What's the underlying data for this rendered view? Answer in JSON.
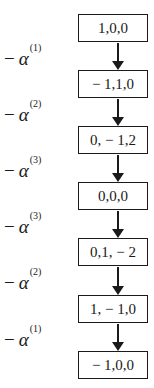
{
  "diagram": {
    "type": "vertical-flow",
    "nodes": [
      {
        "label": "1,0,0"
      },
      {
        "label": "− 1,1,0"
      },
      {
        "label": "0, − 1,2"
      },
      {
        "label": "0,0,0"
      },
      {
        "label": "0,1, − 2"
      },
      {
        "label": "1, − 1,0"
      },
      {
        "label": "− 1,0,0"
      }
    ],
    "edges": [
      {
        "from": 0,
        "to": 1,
        "minus": "−",
        "symbol": "α",
        "superscript": "(1)"
      },
      {
        "from": 1,
        "to": 2,
        "minus": "−",
        "symbol": "α",
        "superscript": "(2)"
      },
      {
        "from": 2,
        "to": 3,
        "minus": "−",
        "symbol": "α",
        "superscript": "(3)"
      },
      {
        "from": 3,
        "to": 4,
        "minus": "−",
        "symbol": "α",
        "superscript": "(3)"
      },
      {
        "from": 4,
        "to": 5,
        "minus": "−",
        "symbol": "α",
        "superscript": "(2)"
      },
      {
        "from": 5,
        "to": 6,
        "minus": "−",
        "symbol": "α",
        "superscript": "(1)"
      }
    ],
    "colors": {
      "stroke": "#1a1a1a",
      "background": "#ffffff"
    }
  }
}
